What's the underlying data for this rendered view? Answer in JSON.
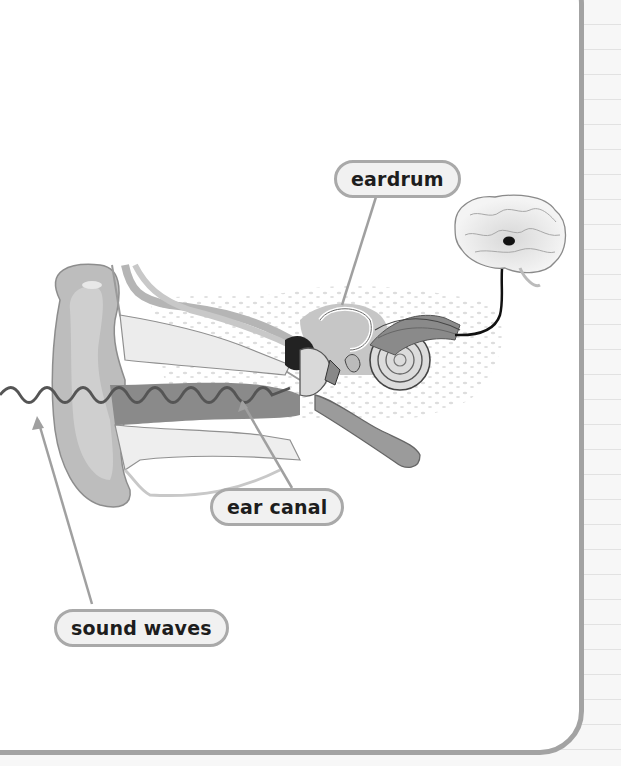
{
  "diagram": {
    "labels": {
      "eardrum": "eardrum",
      "ear_canal": "ear canal",
      "sound_waves": "sound waves"
    },
    "parts": [
      "outer ear",
      "ear canal",
      "eardrum",
      "middle ear bones",
      "cochlea",
      "auditory nerve",
      "brain"
    ],
    "colors": {
      "frame_border": "#a3a3a3",
      "label_fill": "#f1f1f1",
      "label_border": "#a9a9a9",
      "label_text": "#1d1d1d",
      "leader_line": "#a0a0a0",
      "sound_wave": "#555555",
      "nerve_path": "#111111"
    }
  }
}
